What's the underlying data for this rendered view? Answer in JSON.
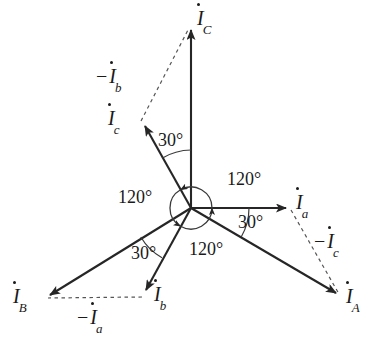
{
  "figure": {
    "type": "phasor-diagram",
    "background_color": "#ffffff",
    "line_color": "#262626",
    "text_color": "#1a1a1a",
    "width": 378,
    "height": 343
  },
  "origin": {
    "x": 191,
    "y": 208
  },
  "phasors": [
    {
      "id": "IC",
      "base": "I",
      "sub": "C",
      "label": "İ_C",
      "angle_deg": 90,
      "length": 182,
      "style": "solid",
      "label_pos": {
        "x": 197,
        "y": 10
      },
      "tip": {
        "x": 191,
        "y": 26
      }
    },
    {
      "id": "Ia",
      "base": "I",
      "sub": "a",
      "label": "İ_a",
      "angle_deg": 0,
      "length": 99,
      "style": "solid",
      "label_pos": {
        "x": 296,
        "y": 194
      },
      "tip": {
        "x": 290,
        "y": 208
      }
    },
    {
      "id": "Ic",
      "base": "I",
      "sub": "c",
      "label": "İ_c",
      "angle_deg": 120,
      "length": 100,
      "style": "solid",
      "label_pos": {
        "x": 108,
        "y": 110
      },
      "tip": {
        "x": 141,
        "y": 121
      }
    },
    {
      "id": "Ib",
      "base": "I",
      "sub": "b",
      "label": "İ_b",
      "angle_deg": 240,
      "length": 99,
      "style": "solid",
      "label_pos": {
        "x": 155,
        "y": 286
      },
      "tip": {
        "x": 142,
        "y": 294
      }
    },
    {
      "id": "IA",
      "base": "I",
      "sub": "A",
      "label": "İ_A",
      "angle_deg": -30,
      "length": 176,
      "style": "solid",
      "label_pos": {
        "x": 348,
        "y": 288
      },
      "tip": {
        "x": 341,
        "y": 297
      }
    },
    {
      "id": "IB",
      "base": "I",
      "sub": "B",
      "label": "İ_B",
      "angle_deg": 210,
      "length": 172,
      "style": "solid",
      "label_pos": {
        "x": 14,
        "y": 288
      },
      "tip": {
        "x": 44,
        "y": 298
      }
    }
  ],
  "dashed_segments": [
    {
      "id": "minus-Ib",
      "base": "I",
      "sub": "b",
      "label": "−İ_b",
      "from": {
        "x": 141,
        "y": 121
      },
      "to": {
        "x": 191,
        "y": 26
      },
      "label_pos": {
        "x": 97,
        "y": 69
      }
    },
    {
      "id": "minus-Ic",
      "base": "I",
      "sub": "c",
      "label": "−İ_c",
      "from": {
        "x": 290,
        "y": 208
      },
      "to": {
        "x": 341,
        "y": 297
      },
      "label_pos": {
        "x": 315,
        "y": 233
      }
    },
    {
      "id": "minus-Ia",
      "base": "I",
      "sub": "a",
      "label": "−İ_a",
      "from": {
        "x": 142,
        "y": 297
      },
      "to": {
        "x": 46,
        "y": 298
      },
      "label_pos": {
        "x": 78,
        "y": 308
      }
    }
  ],
  "angle_arcs": [
    {
      "id": "arc-120-upper-right",
      "value": "120°",
      "between": [
        "Ia",
        "Ic"
      ],
      "radius": 21,
      "label_pos": {
        "x": 227,
        "y": 170
      }
    },
    {
      "id": "arc-120-left",
      "value": "120°",
      "between": [
        "Ic",
        "Ib"
      ],
      "radius": 21,
      "label_pos": {
        "x": 118,
        "y": 188
      }
    },
    {
      "id": "arc-120-bottom",
      "value": "120°",
      "between": [
        "Ib",
        "Ia"
      ],
      "radius": 21,
      "label_pos": {
        "x": 189,
        "y": 240
      }
    },
    {
      "id": "arc-30-upper",
      "value": "30°",
      "between": [
        "Ic",
        "IC"
      ],
      "radius": 58,
      "label_pos": {
        "x": 158,
        "y": 130
      }
    },
    {
      "id": "arc-30-right",
      "value": "30°",
      "between": [
        "IA",
        "Ia"
      ],
      "radius": 58,
      "label_pos": {
        "x": 237,
        "y": 212
      }
    },
    {
      "id": "arc-30-lower-left",
      "value": "30°",
      "between": [
        "IB",
        "Ib"
      ],
      "radius": 58,
      "label_pos": {
        "x": 131,
        "y": 243
      }
    }
  ]
}
